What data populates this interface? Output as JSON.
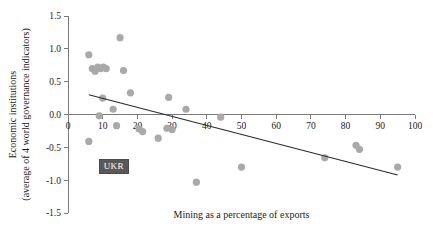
{
  "chart_data": {
    "type": "scatter",
    "title": "",
    "xlabel": "Mining as a percentage of exports",
    "ylabel": "Economic institutions (average of 4 world governance indicators)",
    "ylabel_line1": "Economic institutions",
    "ylabel_line2": "(average of 4 world governance indicators)",
    "xlim": [
      0,
      100
    ],
    "ylim": [
      -1.5,
      1.5
    ],
    "xticks": [
      0,
      10,
      20,
      30,
      40,
      50,
      60,
      70,
      80,
      90,
      100
    ],
    "xtick_labels": [
      "0",
      "10",
      "20",
      "30",
      "40",
      "50",
      "60",
      "70",
      "80",
      "90",
      "100"
    ],
    "yticks": [
      1.5,
      1.0,
      0.5,
      0.0,
      -0.5,
      -1.0,
      -1.5
    ],
    "ytick_labels": [
      "1.5",
      "1.0",
      "0.5",
      "0.0",
      "-0.5",
      "-1.0",
      "-1.5"
    ],
    "grid": false,
    "legend": false,
    "point_color": "#a9a9a9",
    "trendline_color": "#2b2b2b",
    "axis_color": "#7a7a7a",
    "points": [
      {
        "x": 6,
        "y": 0.91
      },
      {
        "x": 7,
        "y": 0.7
      },
      {
        "x": 7.8,
        "y": 0.66
      },
      {
        "x": 8.6,
        "y": 0.72
      },
      {
        "x": 9.4,
        "y": 0.7
      },
      {
        "x": 10.2,
        "y": 0.72
      },
      {
        "x": 11,
        "y": 0.7
      },
      {
        "x": 6,
        "y": -0.41
      },
      {
        "x": 9,
        "y": -0.02
      },
      {
        "x": 10,
        "y": 0.25
      },
      {
        "x": 13,
        "y": 0.08
      },
      {
        "x": 14,
        "y": -0.17
      },
      {
        "x": 15,
        "y": 1.17
      },
      {
        "x": 16,
        "y": 0.67
      },
      {
        "x": 18,
        "y": 0.33
      },
      {
        "x": 20.5,
        "y": -0.22
      },
      {
        "x": 21.5,
        "y": -0.26
      },
      {
        "x": 26,
        "y": -0.36
      },
      {
        "x": 29,
        "y": 0.26
      },
      {
        "x": 28.5,
        "y": -0.21
      },
      {
        "x": 30,
        "y": -0.23
      },
      {
        "x": 34,
        "y": 0.08
      },
      {
        "x": 37,
        "y": -1.03
      },
      {
        "x": 44,
        "y": -0.04
      },
      {
        "x": 50,
        "y": -0.8
      },
      {
        "x": 74,
        "y": -0.66
      },
      {
        "x": 83,
        "y": -0.47
      },
      {
        "x": 84,
        "y": -0.53
      },
      {
        "x": 95,
        "y": -0.8
      }
    ],
    "trendline": {
      "x_start": 6,
      "y_start": 0.3,
      "x_end": 95,
      "y_end": -0.92
    },
    "annotations": [
      {
        "label": "UKR",
        "x": 10,
        "y": -0.78,
        "style": "dark-badge"
      }
    ]
  }
}
